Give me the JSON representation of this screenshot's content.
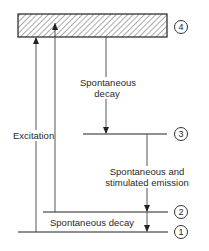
{
  "diagram": {
    "type": "energy-level-diagram",
    "levels": [
      {
        "id": "1",
        "label": "1"
      },
      {
        "id": "2",
        "label": "2"
      },
      {
        "id": "3",
        "label": "3"
      },
      {
        "id": "4",
        "label": "4",
        "style": "hatched-band"
      }
    ],
    "transitions": [
      {
        "from": "1",
        "to": "4",
        "label": "Excitation",
        "direction": "up"
      },
      {
        "from": "2",
        "to": "4",
        "label": "Excitation",
        "direction": "up"
      },
      {
        "from": "4",
        "to": "3",
        "label": "Spontaneous decay",
        "direction": "down"
      },
      {
        "from": "3",
        "to": "2",
        "label": "Spontaneous and stimulated emission",
        "direction": "down"
      },
      {
        "from": "2",
        "to": "1",
        "label": "Spontaneous decay",
        "direction": "down"
      }
    ],
    "labels": {
      "excitation": "Excitation",
      "decay_top_line1": "Spontaneous",
      "decay_top_line2": "decay",
      "emission_line1": "Spontaneous and",
      "emission_line2": "stimulated emission",
      "decay_bottom": "Spontaneous decay"
    },
    "level_markers": {
      "l1": "1",
      "l2": "2",
      "l3": "3",
      "l4": "4"
    }
  }
}
